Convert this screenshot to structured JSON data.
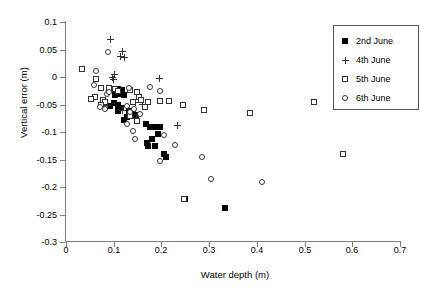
{
  "chart_data": {
    "type": "scatter",
    "title": "",
    "xlabel": "Water depth (m)",
    "ylabel": "Vertical error (m)",
    "xlim": [
      0,
      0.7
    ],
    "ylim": [
      -0.3,
      0.1
    ],
    "xticks": [
      "0",
      "0.1",
      "0.2",
      "0.3",
      "0.4",
      "0.5",
      "0.6",
      "0.7"
    ],
    "xtick_values": [
      0,
      0.1,
      0.2,
      0.3,
      0.4,
      0.5,
      0.6,
      0.7
    ],
    "yticks": [
      "0.1",
      "0.05",
      "0",
      "-0.05",
      "-0.1",
      "-0.15",
      "-0.2",
      "-0.25",
      "-0.3"
    ],
    "ytick_values": [
      0.1,
      0.05,
      0,
      -0.05,
      -0.1,
      -0.15,
      -0.2,
      -0.25,
      -0.3
    ],
    "grid": false,
    "legend_position": "top-right",
    "series": [
      {
        "name": "2nd June",
        "marker": "filled-square",
        "color": "#000000",
        "points": [
          [
            0.098,
            -0.022
          ],
          [
            0.108,
            -0.021
          ],
          [
            0.118,
            -0.024
          ],
          [
            0.113,
            -0.03
          ],
          [
            0.103,
            -0.033
          ],
          [
            0.122,
            -0.033
          ],
          [
            0.1,
            -0.047
          ],
          [
            0.092,
            -0.052
          ],
          [
            0.11,
            -0.05
          ],
          [
            0.115,
            -0.057
          ],
          [
            0.108,
            -0.062
          ],
          [
            0.131,
            -0.062
          ],
          [
            0.14,
            -0.066
          ],
          [
            0.146,
            -0.069
          ],
          [
            0.128,
            -0.072
          ],
          [
            0.121,
            -0.078
          ],
          [
            0.168,
            -0.086
          ],
          [
            0.175,
            -0.09
          ],
          [
            0.186,
            -0.09
          ],
          [
            0.196,
            -0.091
          ],
          [
            0.193,
            -0.104
          ],
          [
            0.18,
            -0.112
          ],
          [
            0.17,
            -0.12
          ],
          [
            0.172,
            -0.126
          ],
          [
            0.186,
            -0.125
          ],
          [
            0.205,
            -0.14
          ],
          [
            0.21,
            -0.145
          ],
          [
            0.25,
            -0.222
          ],
          [
            0.333,
            -0.238
          ]
        ]
      },
      {
        "name": "4th June",
        "marker": "plus",
        "color": "#333333",
        "points": [
          [
            0.093,
            0.068
          ],
          [
            0.118,
            0.046
          ],
          [
            0.114,
            0.038
          ],
          [
            0.122,
            0.036
          ],
          [
            0.101,
            0.005
          ],
          [
            0.098,
            0.0
          ],
          [
            0.1,
            -0.004
          ],
          [
            0.196,
            -0.002
          ],
          [
            0.086,
            -0.051
          ],
          [
            0.146,
            -0.047
          ],
          [
            0.16,
            -0.05
          ],
          [
            0.119,
            -0.06
          ],
          [
            0.148,
            -0.075
          ],
          [
            0.233,
            -0.088
          ]
        ]
      },
      {
        "name": "5th June",
        "marker": "open-square",
        "color": "#333333",
        "points": [
          [
            0.034,
            0.014
          ],
          [
            0.062,
            -0.004
          ],
          [
            0.073,
            -0.02
          ],
          [
            0.09,
            -0.02
          ],
          [
            0.103,
            -0.022
          ],
          [
            0.109,
            -0.025
          ],
          [
            0.135,
            -0.023
          ],
          [
            0.148,
            -0.028
          ],
          [
            0.06,
            -0.036
          ],
          [
            0.053,
            -0.04
          ],
          [
            0.078,
            -0.041
          ],
          [
            0.082,
            -0.046
          ],
          [
            0.073,
            -0.051
          ],
          [
            0.14,
            -0.046
          ],
          [
            0.152,
            -0.036
          ],
          [
            0.158,
            -0.041
          ],
          [
            0.172,
            -0.046
          ],
          [
            0.166,
            -0.054
          ],
          [
            0.198,
            -0.044
          ],
          [
            0.216,
            -0.044
          ],
          [
            0.135,
            -0.07
          ],
          [
            0.246,
            -0.05
          ],
          [
            0.29,
            -0.06
          ],
          [
            0.385,
            -0.065
          ],
          [
            0.52,
            -0.045
          ],
          [
            0.58,
            -0.14
          ],
          [
            0.248,
            -0.222
          ],
          [
            0.148,
            -0.08
          ]
        ]
      },
      {
        "name": "6th June",
        "marker": "open-circle",
        "color": "#333333",
        "points": [
          [
            0.088,
            0.046
          ],
          [
            0.063,
            0.011
          ],
          [
            0.058,
            -0.015
          ],
          [
            0.085,
            -0.03
          ],
          [
            0.091,
            -0.027
          ],
          [
            0.132,
            -0.02
          ],
          [
            0.175,
            -0.018
          ],
          [
            0.196,
            -0.026
          ],
          [
            0.072,
            -0.055
          ],
          [
            0.082,
            -0.058
          ],
          [
            0.127,
            -0.052
          ],
          [
            0.142,
            -0.058
          ],
          [
            0.135,
            -0.064
          ],
          [
            0.156,
            -0.068
          ],
          [
            0.128,
            -0.086
          ],
          [
            0.14,
            -0.098
          ],
          [
            0.145,
            -0.112
          ],
          [
            0.206,
            -0.106
          ],
          [
            0.228,
            -0.124
          ],
          [
            0.198,
            -0.153
          ],
          [
            0.285,
            -0.145
          ],
          [
            0.303,
            -0.185
          ],
          [
            0.41,
            -0.19
          ]
        ]
      }
    ]
  },
  "legend": {
    "entries": [
      {
        "label": "2nd June",
        "marker": "filled-square"
      },
      {
        "label": "4th June",
        "marker": "plus"
      },
      {
        "label": "5th June",
        "marker": "open-square"
      },
      {
        "label": "6th June",
        "marker": "open-circle"
      }
    ]
  }
}
